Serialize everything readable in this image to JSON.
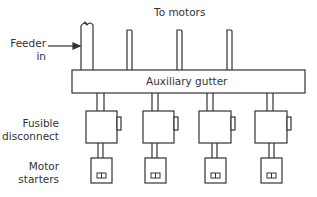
{
  "labels": {
    "to_motors": "To motors",
    "feeder_line1": "Feeder",
    "feeder_line2": "in",
    "gutter": "Auxiliary gutter",
    "fusible_line1": "Fusible",
    "fusible_line2": "disconnect",
    "motor_line1": "Motor",
    "motor_line2": "starters"
  },
  "units": {
    "count": 4
  },
  "colors": {
    "stroke": "#333333",
    "text": "#333333"
  }
}
